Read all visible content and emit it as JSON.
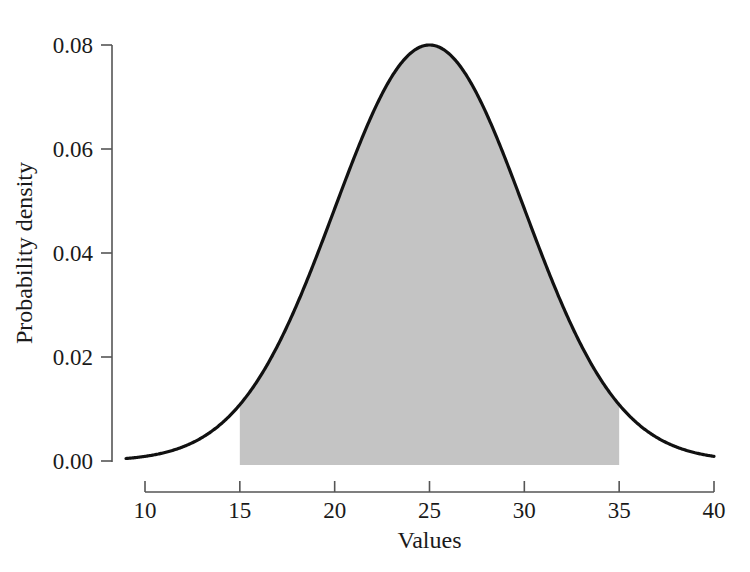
{
  "chart_data": {
    "type": "area",
    "title": "",
    "subtitle": "",
    "xlabel": "Values",
    "ylabel": "Probability density",
    "xlim": [
      9.0,
      40.0
    ],
    "ylim": [
      0.0,
      0.08
    ],
    "grid": false,
    "legend": null,
    "distribution": {
      "family": "normal",
      "mean": 25,
      "sd": 5,
      "peak_density": 0.08
    },
    "shaded_region": {
      "label": "",
      "x_start": 15,
      "x_end": 35,
      "fill_color": "#c4c4c4",
      "baseline": 0.0
    },
    "curve_color": "#111111",
    "x_ticks": [
      {
        "value": 10,
        "label": "10"
      },
      {
        "value": 15,
        "label": "15"
      },
      {
        "value": 20,
        "label": "20"
      },
      {
        "value": 25,
        "label": "25"
      },
      {
        "value": 30,
        "label": "30"
      },
      {
        "value": 35,
        "label": "35"
      },
      {
        "value": 40,
        "label": "40"
      }
    ],
    "y_ticks": [
      {
        "value": 0.0,
        "label": "0.00"
      },
      {
        "value": 0.02,
        "label": "0.02"
      },
      {
        "value": 0.04,
        "label": "0.04"
      },
      {
        "value": 0.06,
        "label": "0.06"
      },
      {
        "value": 0.08,
        "label": "0.08"
      }
    ],
    "x": [
      9.0,
      9.5,
      10.0,
      10.5,
      11.0,
      11.5,
      12.0,
      12.5,
      13.0,
      13.5,
      14.0,
      14.5,
      15.0,
      15.5,
      16.0,
      16.5,
      17.0,
      17.5,
      18.0,
      18.5,
      19.0,
      19.5,
      20.0,
      20.5,
      21.0,
      21.5,
      22.0,
      22.5,
      23.0,
      23.5,
      24.0,
      24.5,
      25.0,
      25.5,
      26.0,
      26.5,
      27.0,
      27.5,
      28.0,
      28.5,
      29.0,
      29.5,
      30.0,
      30.5,
      31.0,
      31.5,
      32.0,
      32.5,
      33.0,
      33.5,
      34.0,
      34.5,
      35.0,
      35.5,
      36.0,
      36.5,
      37.0,
      37.5,
      38.0,
      38.5,
      39.0,
      39.5,
      40.0
    ],
    "y": [
      0.0008,
      0.0011,
      0.0016,
      0.0022,
      0.0029,
      0.0038,
      0.0049,
      0.0063,
      0.0079,
      0.0099,
      0.0122,
      0.0148,
      0.018,
      0.0213,
      0.0252,
      0.0293,
      0.0338,
      0.0386,
      0.0435,
      0.0485,
      0.0535,
      0.0584,
      0.0631,
      0.0674,
      0.0713,
      0.0746,
      0.0773,
      0.0793,
      0.0805,
      0.081,
      0.0805,
      0.0793,
      0.08,
      0.0793,
      0.0805,
      0.081,
      0.0805,
      0.0793,
      0.0773,
      0.0746,
      0.0713,
      0.0674,
      0.0631,
      0.0584,
      0.0535,
      0.0485,
      0.0435,
      0.0386,
      0.0338,
      0.0293,
      0.0252,
      0.0213,
      0.018,
      0.0148,
      0.0122,
      0.0099,
      0.0079,
      0.0063,
      0.0049,
      0.0038,
      0.0029,
      0.0022,
      0.0016
    ]
  },
  "axes": {
    "x_title": "Values",
    "y_title": "Probability density",
    "x_tick_labels": [
      "10",
      "15",
      "20",
      "25",
      "30",
      "35",
      "40"
    ],
    "y_tick_labels": [
      "0.00",
      "0.02",
      "0.04",
      "0.06",
      "0.08"
    ]
  },
  "colors": {
    "curve": "#111111",
    "shading": "#c4c4c4",
    "axis": "#555555",
    "text": "#1a1a1a",
    "background": "#ffffff"
  }
}
